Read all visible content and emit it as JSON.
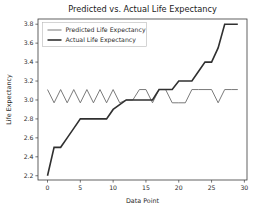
{
  "chart_data": {
    "type": "line",
    "title": "Predicted vs. Actual Life Expectancy",
    "xlabel": "Data Point",
    "ylabel": "Life Expectancy",
    "xlim": [
      -1.45,
      30.4
    ],
    "ylim": [
      2.155,
      3.855
    ],
    "xticks": [
      0,
      5,
      10,
      15,
      20,
      25,
      30
    ],
    "xtick_labels": [
      "0",
      "5",
      "10",
      "15",
      "20",
      "25",
      "30"
    ],
    "yticks": [
      2.2,
      2.4,
      2.6,
      2.8,
      3.0,
      3.2,
      3.4,
      3.6,
      3.8
    ],
    "ytick_labels": [
      "2.2",
      "2.4",
      "2.6",
      "2.8",
      "3.0",
      "3.2",
      "3.4",
      "3.6",
      "3.8"
    ],
    "grid": false,
    "legend_position": "upper left",
    "x": [
      0,
      1,
      2,
      3,
      4,
      5,
      6,
      7,
      8,
      9,
      10,
      11,
      12,
      13,
      14,
      15,
      16,
      17,
      18,
      19,
      20,
      21,
      22,
      23,
      24,
      25,
      26,
      27,
      28,
      29
    ],
    "series": [
      {
        "name": "Predicted Life Expectancy",
        "color": "#6b6b6b",
        "linewidth": 0.9,
        "values": [
          3.11,
          2.97,
          3.11,
          2.97,
          3.11,
          2.97,
          3.11,
          2.97,
          3.11,
          2.97,
          3.11,
          2.97,
          3.0,
          3.0,
          3.11,
          3.11,
          2.97,
          3.11,
          3.11,
          2.97,
          2.97,
          2.97,
          3.11,
          3.11,
          3.11,
          3.11,
          2.97,
          3.11,
          3.11,
          3.11
        ]
      },
      {
        "name": "Actual Life Expectancy",
        "color": "#303030",
        "linewidth": 1.6,
        "values": [
          2.2,
          2.5,
          2.5,
          2.6,
          2.7,
          2.8,
          2.8,
          2.8,
          2.8,
          2.8,
          2.9,
          2.95,
          3.0,
          3.0,
          3.0,
          3.0,
          3.0,
          3.11,
          3.11,
          3.11,
          3.2,
          3.2,
          3.2,
          3.3,
          3.4,
          3.4,
          3.55,
          3.8,
          3.8,
          3.8
        ]
      }
    ],
    "legend_entries": [
      "Predicted Life Expectancy",
      "Actual Life Expectancy"
    ]
  }
}
